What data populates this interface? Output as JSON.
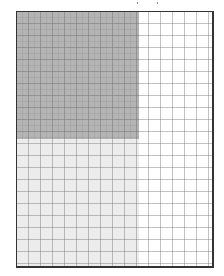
{
  "diagram": {
    "type": "grid-panel",
    "frame": {
      "x": 16,
      "y": 11,
      "width": 196,
      "height": 255,
      "border_color": "#333333"
    },
    "grid": {
      "cell_size_px": 12,
      "line_color": "#9a9a9a",
      "style": "dashed"
    },
    "regions": [
      {
        "name": "dark-shaded-region",
        "x": 0,
        "y": 0,
        "width": 122,
        "height": 127,
        "color": "#b4b4b4"
      },
      {
        "name": "light-shaded-region",
        "x": 0,
        "y": 127,
        "width": 122,
        "height": 128,
        "color": "#ececec"
      },
      {
        "name": "unshaded-region",
        "x": 122,
        "y": 0,
        "width": 74,
        "height": 255,
        "color": "#ffffff"
      }
    ],
    "colors": {
      "dark": "#b4b4b4",
      "light": "#ececec",
      "background": "#ffffff"
    }
  }
}
